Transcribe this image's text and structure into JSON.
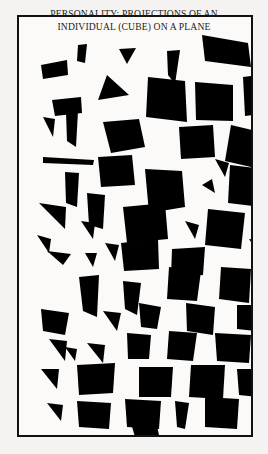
{
  "figure": {
    "title": "PERSONALITY: PROJECTIONS OF AN\nINDIVIDUAL (CUBE) ON A PLANE",
    "title_line_1": "PERSONALITY: PROJECTIONS OF AN",
    "title_line_2": "INDIVIDUAL (CUBE) ON A PLANE",
    "background_color": "#f4f3f1",
    "panel_color": "#fbfaf8",
    "ink_color": "#000000",
    "frame_color": "#111111",
    "panel_width": 236,
    "panel_height": 422,
    "shape_count": 66,
    "caption_alt": "Scattered black polygons representing random planar projections of a cube"
  },
  "chart_data": {
    "type": "scatter",
    "title": "PERSONALITY: PROJECTIONS OF AN INDIVIDUAL (CUBE) ON A PLANE",
    "xlabel": "",
    "ylabel": "",
    "xlim": [
      0,
      236
    ],
    "ylim": [
      0,
      422
    ],
    "grid": false,
    "legend": null,
    "marker_type": "filled-polygon",
    "marker_color": "#000000",
    "shapes": [
      {
        "id": 1,
        "points": "22,48 48,43 49,58 24,62"
      },
      {
        "id": 2,
        "points": "59,28 68,27 66,46 58,44"
      },
      {
        "id": 3,
        "points": "100,32 117,31 108,47"
      },
      {
        "id": 4,
        "points": "148,34 161,33 156,67 149,58"
      },
      {
        "id": 5,
        "points": "183,18 229,26 232,50 186,44"
      },
      {
        "id": 6,
        "points": "33,83 62,80 63,96 36,99"
      },
      {
        "id": 7,
        "points": "88,58 110,78 79,83"
      },
      {
        "id": 8,
        "points": "129,60 166,64 168,105 127,100"
      },
      {
        "id": 9,
        "points": "176,65 214,68 214,104 177,103"
      },
      {
        "id": 10,
        "points": "224,60 247,57 250,96 226,99"
      },
      {
        "id": 11,
        "points": "236,52 258,57 250,86 231,78"
      },
      {
        "id": 12,
        "points": "47,95 59,94 57,130 48,124"
      },
      {
        "id": 13,
        "points": "24,140 75,143 74,148 24,146"
      },
      {
        "id": 14,
        "points": "84,105 120,102 126,130 92,136"
      },
      {
        "id": 15,
        "points": "160,110 194,108 196,140 162,142"
      },
      {
        "id": 16,
        "points": "212,108 246,116 240,152 206,144"
      },
      {
        "id": 17,
        "points": "46,155 60,156 58,190 47,186"
      },
      {
        "id": 18,
        "points": "79,140 113,138 116,168 82,170"
      },
      {
        "id": 19,
        "points": "126,152 163,154 166,190 130,196"
      },
      {
        "id": 20,
        "points": "183,168 193,162 196,176"
      },
      {
        "id": 21,
        "points": "211,148 246,152 244,190 209,186"
      },
      {
        "id": 22,
        "points": "20,186 47,190 46,212"
      },
      {
        "id": 23,
        "points": "68,176 86,178 84,212 70,208"
      },
      {
        "id": 24,
        "points": "104,190 146,186 149,222 108,226"
      },
      {
        "id": 25,
        "points": "189,192 226,196 222,232 186,228"
      },
      {
        "id": 26,
        "points": "244,182 252,182 252,214 244,212"
      },
      {
        "id": 27,
        "points": "28,234 52,237 44,248"
      },
      {
        "id": 28,
        "points": "66,236 78,236 74,250"
      },
      {
        "id": 29,
        "points": "102,226 139,222 140,252 105,254"
      },
      {
        "id": 30,
        "points": "153,232 186,230 184,258 152,260"
      },
      {
        "id": 31,
        "points": "60,260 80,258 78,300 64,294"
      },
      {
        "id": 32,
        "points": "104,264 122,266 118,298 106,292"
      },
      {
        "id": 33,
        "points": "150,250 182,254 178,284 148,282"
      },
      {
        "id": 34,
        "points": "202,250 232,252 230,286 200,282"
      },
      {
        "id": 35,
        "points": "244,248 252,248 250,282 243,280"
      },
      {
        "id": 36,
        "points": "22,292 50,296 46,318 24,314"
      },
      {
        "id": 37,
        "points": "84,294 102,296 98,314"
      },
      {
        "id": 38,
        "points": "120,286 142,290 138,312 122,310"
      },
      {
        "id": 39,
        "points": "167,286 196,290 194,318 168,314"
      },
      {
        "id": 40,
        "points": "218,288 238,288 236,314 218,312"
      },
      {
        "id": 41,
        "points": "30,322 48,324 46,344"
      },
      {
        "id": 42,
        "points": "68,326 86,328 84,346"
      },
      {
        "id": 43,
        "points": "108,316 132,318 130,342 109,342"
      },
      {
        "id": 44,
        "points": "150,314 178,316 174,344 148,342"
      },
      {
        "id": 45,
        "points": "196,316 232,318 230,346 198,344"
      },
      {
        "id": 46,
        "points": "22,352 40,352 38,372"
      },
      {
        "id": 47,
        "points": "58,348 96,346 94,376 60,378"
      },
      {
        "id": 48,
        "points": "120,350 154,350 152,380 120,380"
      },
      {
        "id": 49,
        "points": "172,348 206,348 204,382 170,380"
      },
      {
        "id": 50,
        "points": "218,352 240,352 238,380 220,378"
      },
      {
        "id": 51,
        "points": "28,386 44,388 42,404"
      },
      {
        "id": 52,
        "points": "58,384 92,386 90,412 60,410"
      },
      {
        "id": 53,
        "points": "106,382 142,384 140,412 108,410"
      },
      {
        "id": 54,
        "points": "156,384 170,386 166,412 158,410"
      },
      {
        "id": 55,
        "points": "186,380 220,382 218,412 186,410"
      },
      {
        "id": 56,
        "points": "232,382 250,384 248,410 233,408"
      },
      {
        "id": 57,
        "points": "18,218 32,222 30,236"
      },
      {
        "id": 58,
        "points": "230,222 248,224 246,246"
      },
      {
        "id": 59,
        "points": "62,204 76,206 74,222"
      },
      {
        "id": 60,
        "points": "166,204 180,208 176,222"
      },
      {
        "id": 61,
        "points": "24,100 36,102 34,120"
      },
      {
        "id": 62,
        "points": "196,142 210,146 206,160"
      },
      {
        "id": 63,
        "points": "112,406 136,400 140,418 116,420"
      },
      {
        "id": 64,
        "points": "46,330 58,332 56,344"
      },
      {
        "id": 65,
        "points": "240,320 252,322 250,342"
      },
      {
        "id": 66,
        "points": "86,226 100,228 96,244"
      }
    ],
    "note": "Each filled polygon is one silhouette of a cube projected onto the picture plane at a random orientation."
  }
}
